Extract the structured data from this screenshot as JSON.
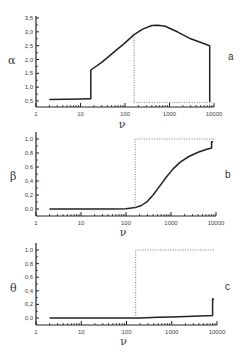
{
  "chart_data": [
    {
      "type": "line",
      "panel_label": "a",
      "ylabel": "α",
      "xlabel": "ν",
      "xscale": "log",
      "xlim": [
        1,
        10000
      ],
      "ylim": [
        0.3,
        3.5
      ],
      "xticks": [
        "1",
        "10",
        "100",
        "1000",
        "10000"
      ],
      "yticks": [
        "0.5",
        "1.0",
        "1.5",
        "2.0",
        "2.5",
        "3.0",
        "3.5"
      ],
      "ytick_values": [
        0.5,
        1.0,
        1.5,
        2.0,
        2.5,
        3.0,
        3.5
      ],
      "series": [
        {
          "name": "solid",
          "style": "solid",
          "x": [
            2,
            5,
            10,
            16,
            17,
            17,
            30,
            60,
            100,
            160,
            250,
            400,
            550,
            800,
            1500,
            3000,
            8000,
            8000,
            8400
          ],
          "y": [
            0.55,
            0.56,
            0.57,
            0.58,
            0.58,
            1.62,
            1.9,
            2.3,
            2.6,
            2.9,
            3.1,
            3.23,
            3.24,
            3.2,
            3.0,
            2.75,
            2.5,
            0.5,
            0.5
          ]
        },
        {
          "name": "dotted",
          "style": "dotted",
          "x": [
            160,
            160,
            9000,
            9000
          ],
          "y": [
            2.8,
            0.45,
            0.45,
            0.5
          ]
        }
      ]
    },
    {
      "type": "line",
      "panel_label": "b",
      "ylabel": "β",
      "xlabel": "ν",
      "xscale": "log",
      "xlim": [
        1,
        10000
      ],
      "ylim": [
        -0.1,
        1.05
      ],
      "xticks": [
        "1",
        "10",
        "100",
        "1000",
        "10000"
      ],
      "yticks": [
        "0.0",
        "0.2",
        "0.4",
        "0.6",
        "0.8",
        "1.0"
      ],
      "ytick_values": [
        0.0,
        0.2,
        0.4,
        0.6,
        0.8,
        1.0
      ],
      "series": [
        {
          "name": "solid",
          "style": "solid",
          "x": [
            2,
            10,
            50,
            100,
            160,
            220,
            300,
            400,
            550,
            800,
            1100,
            1600,
            2500,
            4000,
            6000,
            8000,
            8000,
            8600
          ],
          "y": [
            0.0,
            0.0,
            0.0,
            0.005,
            0.02,
            0.05,
            0.11,
            0.2,
            0.32,
            0.46,
            0.57,
            0.67,
            0.75,
            0.81,
            0.85,
            0.87,
            0.96,
            0.96
          ]
        },
        {
          "name": "dotted",
          "style": "dotted",
          "x": [
            160,
            160,
            9000,
            9000
          ],
          "y": [
            0.02,
            1.0,
            1.0,
            0.96
          ]
        }
      ]
    },
    {
      "type": "line",
      "panel_label": "c",
      "ylabel": "θ",
      "xlabel": "ν",
      "xscale": "log",
      "xlim": [
        1,
        10000
      ],
      "ylim": [
        -0.1,
        1.1
      ],
      "xticks": [
        "1",
        "10",
        "100",
        "1000",
        "10000"
      ],
      "yticks": [
        "0.0",
        "0.2",
        "0.4",
        "0.6",
        "0.8",
        "1.0"
      ],
      "ytick_values": [
        0.0,
        0.2,
        0.4,
        0.6,
        0.8,
        1.0
      ],
      "series": [
        {
          "name": "solid",
          "style": "solid",
          "x": [
            2,
            100,
            200,
            500,
            1000,
            3000,
            8000,
            8000,
            8600
          ],
          "y": [
            0.0,
            0.0,
            0.0,
            0.01,
            0.015,
            0.025,
            0.035,
            0.28,
            0.28
          ]
        },
        {
          "name": "dotted",
          "style": "dotted",
          "x": [
            160,
            160,
            9000
          ],
          "y": [
            0.0,
            1.0,
            1.0
          ]
        }
      ]
    }
  ],
  "layout": {
    "panels": [
      {
        "x0": 36,
        "x1": 214,
        "xaxis_y": 107,
        "yaxis_top": 16,
        "yv0": 0.5,
        "ypx0": 101,
        "yv1": 3.5,
        "ypx1": 18,
        "label_x": 228,
        "label_y": 60,
        "ylabel_x": 8,
        "ylabel_y": 64,
        "xlabel_y": 128
      },
      {
        "x0": 36,
        "x1": 216,
        "xaxis_y": 216,
        "yaxis_top": 132,
        "yv0": 0.0,
        "ypx0": 209,
        "yv1": 1.0,
        "ypx1": 139,
        "label_x": 225,
        "label_y": 178,
        "ylabel_x": 10,
        "ylabel_y": 180,
        "xlabel_y": 236
      },
      {
        "x0": 36,
        "x1": 217,
        "xaxis_y": 325,
        "yaxis_top": 243,
        "yv0": 0.0,
        "ypx0": 318,
        "yv1": 1.0,
        "ypx1": 250,
        "label_x": 225,
        "label_y": 290,
        "ylabel_x": 10,
        "ylabel_y": 292,
        "xlabel_y": 345
      }
    ],
    "colors": {
      "line": "#222222",
      "axis": "#222222",
      "dotted": "#777777"
    }
  }
}
